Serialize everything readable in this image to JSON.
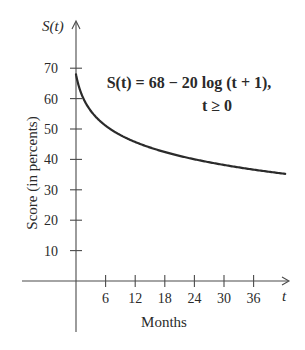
{
  "chart_data": {
    "type": "line",
    "title": "",
    "function_label": "S(t) = 68 − 20 log (t + 1),",
    "domain_label": "t ≥ 0",
    "formula": {
      "a": 68,
      "b": 20,
      "log_base": 10
    },
    "xlabel": "Months",
    "ylabel": "Score (in percents)",
    "x_axis_symbol": "t",
    "y_axis_symbol": "S(t)",
    "x_ticks": [
      6,
      12,
      18,
      24,
      30,
      36
    ],
    "y_ticks": [
      10,
      20,
      30,
      40,
      50,
      60,
      70
    ],
    "xlim": [
      0,
      42
    ],
    "ylim": [
      0,
      70
    ],
    "grid": false,
    "legend": "none",
    "series": [
      {
        "name": "S(t)",
        "x": [
          0,
          1,
          2,
          3,
          6,
          12,
          18,
          24,
          30,
          36,
          42
        ],
        "values": [
          68,
          62.0,
          58.5,
          56.0,
          51.1,
          45.7,
          42.4,
          40.0,
          38.2,
          36.6,
          35.3
        ]
      }
    ]
  },
  "labels": {
    "y_symbol": "S(t)",
    "x_symbol": "t",
    "ylabel": "Score (in percents)",
    "xlabel": "Months",
    "eq_line1": "S(t) = 68 − 20 log (t + 1),",
    "eq_line2": "t ≥ 0"
  }
}
